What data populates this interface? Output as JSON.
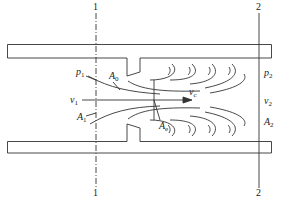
{
  "diagram": {
    "type": "orifice flow through pipe (vena contracta)",
    "section_labels": {
      "sec1_top": "1",
      "sec1_bottom": "1",
      "sec2_top": "2",
      "sec2_bottom": "2"
    },
    "labels": {
      "p1": {
        "main": "p",
        "sub": "1"
      },
      "A0": {
        "main": "A",
        "sub": "0"
      },
      "v1": {
        "main": "v",
        "sub": "1"
      },
      "A1": {
        "main": "A",
        "sub": "1"
      },
      "vc": {
        "main": "v",
        "sub": "c"
      },
      "Ae": {
        "main": "A",
        "sub": "e"
      },
      "p2": {
        "main": "p",
        "sub": "2"
      },
      "v2": {
        "main": "v",
        "sub": "2"
      },
      "A2": {
        "main": "A",
        "sub": "2"
      }
    },
    "colors": {
      "stroke": "#333333",
      "background": "#ffffff"
    }
  }
}
